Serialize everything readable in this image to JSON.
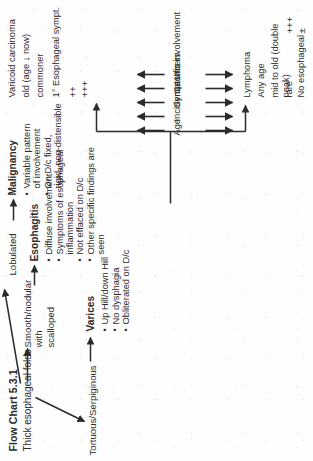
{
  "figure": {
    "title": "Flow Chart 5.3.1",
    "root": "Thick esophageal folds",
    "orientation_degrees": -90
  },
  "branches": [
    {
      "key": "varices",
      "morphology": "Tortuous/Serpiginous",
      "heading": "Varices",
      "bullets": [
        "Up Hill/down Hill",
        "No dysphagia",
        "Obliterated on D/c"
      ]
    },
    {
      "key": "esophagitis",
      "morphology": "Smooth/nodular with\nscalloped",
      "heading": "Esophagitis",
      "bullets": [
        "Diffuse involvement",
        "Symptoms of esophageal\ninflammation",
        "Not effaced on D/c",
        "Other specific findings are seen"
      ]
    },
    {
      "key": "malignancy",
      "morphology": "Lobulated",
      "heading": "Malignancy",
      "bullets": [
        "Variable pattern\nof involvement",
        "On D/c fixed,\nrigid, non-distensible"
      ]
    }
  ],
  "comparison": {
    "criteria": [
      "Age",
      "Incidence",
      "Symptoms",
      "Gastric involvement",
      "Ulcers"
    ],
    "left_column": {
      "title": "Lymphoma",
      "values": [
        "Any age",
        "mid to old (double peak)",
        "rare",
        "No esophageal",
        "+++",
        "±"
      ]
    },
    "right_column": {
      "title": "Varicoid carcinoma",
      "values": [
        "old (age ↓ now)",
        "commoner",
        "1° Esophageal sympt.",
        "++",
        "+++"
      ]
    },
    "arrow_up": "↑",
    "arrow_down": "↓"
  },
  "colors": {
    "ink": "#2b2b2b",
    "paper": "#fefefe"
  }
}
